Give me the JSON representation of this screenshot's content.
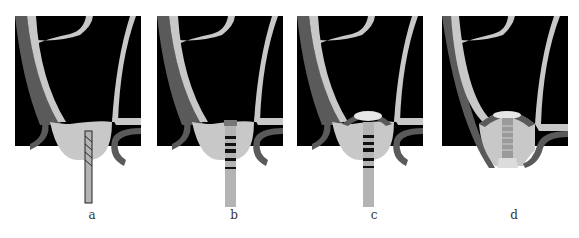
{
  "figure": {
    "panels": [
      {
        "id": "a",
        "label": "a",
        "stage": "drill-insertion",
        "x": 0,
        "label_x": 82
      },
      {
        "id": "b",
        "label": "b",
        "stage": "threaded-implant-placed",
        "x": 142,
        "label_x": 224
      },
      {
        "id": "c",
        "label": "c",
        "stage": "membrane-elevated-graft",
        "x": 282,
        "label_x": 364
      },
      {
        "id": "d",
        "label": "d",
        "stage": "healed-bone-integration",
        "x": 427,
        "label_x": 504
      }
    ],
    "colors": {
      "cavity": "#000000",
      "cortical_bone": "#5a5a5a",
      "cancellous_bone": "#c8c8c8",
      "implant": "#b4b4b4",
      "threads": "#111111",
      "graft": "#e6e6e6",
      "background": "#ffffff"
    }
  }
}
